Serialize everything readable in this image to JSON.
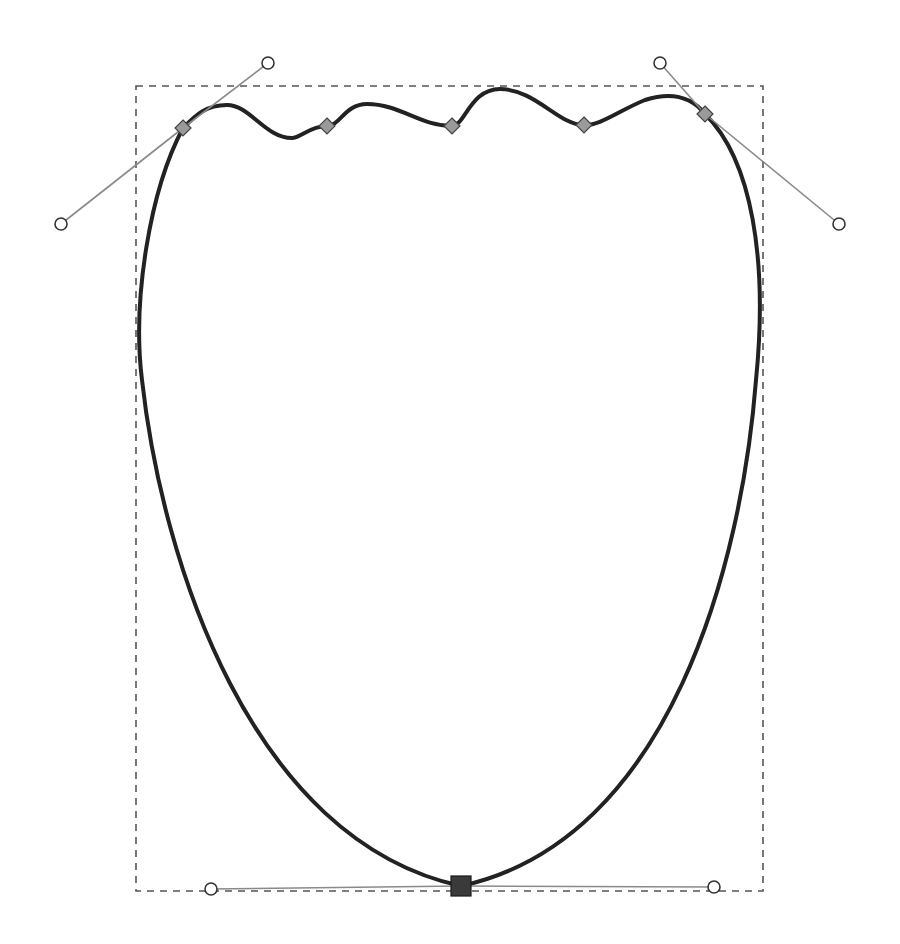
{
  "canvas": {
    "width": 900,
    "height": 944,
    "background": "#ffffff"
  },
  "colors": {
    "path_stroke": "#222222",
    "bbox_stroke": "#555555",
    "handle_line": "#8a8a8a",
    "node_fill": "#9a9a9a",
    "selected_node_fill": "#3a3a3a"
  },
  "selection_bbox": {
    "x": 136,
    "y": 86,
    "width": 627,
    "height": 805
  },
  "path": {
    "d": "M183,128 C150,190 132,300 142,380 C162,560 250,840 461,886 C672,840 742,560 756,380 C768,260 752,160 705,114 C690,95 670,92 645,100 C620,110 600,126 584,125 C560,126 535,89 500,89 C470,89 465,126 452,126 C420,126 400,104 367,104 C345,104 340,126 327,126 C310,126 300,138 292,138 C265,138 250,105 227,105 C205,105 195,116 183,128 Z"
  },
  "nodes": [
    {
      "id": "node-top-left",
      "type": "smooth",
      "x": 183,
      "y": 128
    },
    {
      "id": "node-wave-1",
      "type": "smooth",
      "x": 327,
      "y": 126
    },
    {
      "id": "node-wave-2",
      "type": "smooth",
      "x": 452,
      "y": 126
    },
    {
      "id": "node-wave-3",
      "type": "smooth",
      "x": 584,
      "y": 125
    },
    {
      "id": "node-top-right",
      "type": "smooth",
      "x": 705,
      "y": 114
    },
    {
      "id": "node-bottom",
      "type": "selected",
      "x": 461,
      "y": 886
    }
  ],
  "handles": [
    {
      "id": "handle-top-left-out",
      "node": "node-top-left",
      "x": 268,
      "y": 63
    },
    {
      "id": "handle-top-left-in",
      "node": "node-top-left",
      "x": 61,
      "y": 224
    },
    {
      "id": "handle-top-right-in",
      "node": "node-top-right",
      "x": 660,
      "y": 63
    },
    {
      "id": "handle-top-right-out",
      "node": "node-top-right",
      "x": 839,
      "y": 224
    },
    {
      "id": "handle-bottom-left",
      "node": "node-bottom",
      "x": 211,
      "y": 889
    },
    {
      "id": "handle-bottom-right",
      "node": "node-bottom",
      "x": 714,
      "y": 887
    }
  ]
}
